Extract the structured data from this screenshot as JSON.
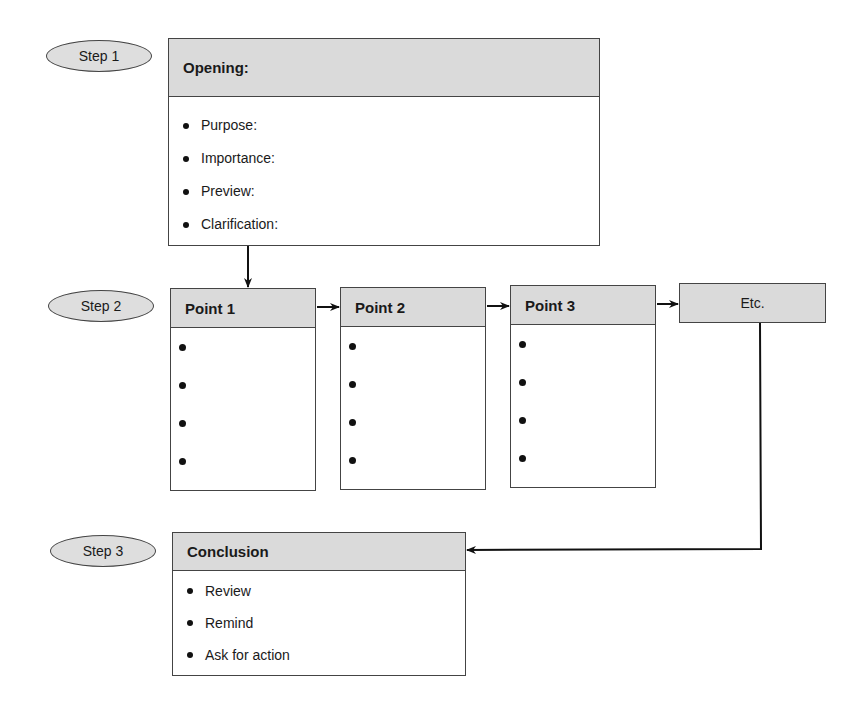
{
  "steps": [
    {
      "label": "Step 1"
    },
    {
      "label": "Step 2"
    },
    {
      "label": "Step 3"
    }
  ],
  "opening": {
    "title": "Opening:",
    "items": [
      "Purpose:",
      "Importance:",
      "Preview:",
      "Clarification:"
    ]
  },
  "points": [
    {
      "title": "Point 1",
      "bullets": 4
    },
    {
      "title": "Point 2",
      "bullets": 4
    },
    {
      "title": "Point 3",
      "bullets": 4
    }
  ],
  "etc": {
    "label": "Etc."
  },
  "conclusion": {
    "title": "Conclusion",
    "items": [
      "Review",
      "Remind",
      "Ask for action"
    ]
  },
  "colors": {
    "header_fill": "#dadada",
    "stroke": "#444444"
  }
}
